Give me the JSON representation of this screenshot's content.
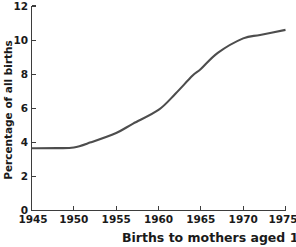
{
  "figure": {
    "caption": "Births to mothers aged 15–19 as",
    "background_color": "#ffffff"
  },
  "chart_data": {
    "type": "line",
    "title": "",
    "subtitle": "",
    "xlabel": "",
    "ylabel": "Percentage of all births",
    "caption": "Births to mothers aged 15–19 as",
    "x": [
      1945,
      1950,
      1955,
      1960,
      1965,
      1970,
      1975
    ],
    "series": [
      {
        "name": "Percentage of all births",
        "color": "#4d4d4d",
        "values": [
          3.65,
          3.7,
          4.55,
          5.9,
          8.3,
          10.1,
          10.6
        ]
      }
    ],
    "dense_points": {
      "x": [
        1945,
        1948,
        1950,
        1952,
        1955,
        1957,
        1960,
        1962,
        1964,
        1965,
        1967,
        1970,
        1972,
        1975
      ],
      "y": [
        3.65,
        3.66,
        3.7,
        4.0,
        4.55,
        5.1,
        5.9,
        6.85,
        7.9,
        8.3,
        9.25,
        10.1,
        10.3,
        10.6
      ]
    },
    "xlim": [
      1945,
      1975
    ],
    "ylim": [
      0,
      12
    ],
    "xticks": [
      1945,
      1950,
      1955,
      1960,
      1965,
      1970,
      1975
    ],
    "xtick_labels": [
      "1945",
      "1950",
      "1955",
      "1960",
      "1965",
      "1970",
      "1975"
    ],
    "yticks": [
      0,
      2,
      4,
      6,
      8,
      10,
      12
    ],
    "ytick_labels": [
      "0",
      "2",
      "4",
      "6",
      "8",
      "10",
      "12"
    ],
    "grid": false,
    "legend": false,
    "legend_position": "none",
    "tick_direction": "in",
    "line_color": "#4d4d4d",
    "axis_color": "#3d3d3d"
  }
}
